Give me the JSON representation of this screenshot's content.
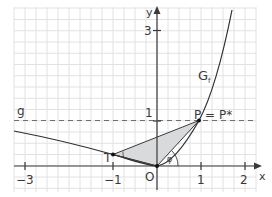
{
  "figure": {
    "grid": {
      "x_min": -3.25,
      "x_max": 2.2,
      "y_min": -0.55,
      "y_max": 3.55,
      "minor_step": 0.25
    },
    "axes": {
      "x_label": "x",
      "y_label": "y",
      "origin_label": "O",
      "x_ticks": [
        {
          "value": -3,
          "label": "−3"
        },
        {
          "value": -1,
          "label": "−1"
        },
        {
          "value": 1,
          "label": "1"
        },
        {
          "value": 2,
          "label": "2"
        }
      ],
      "y_ticks": [
        {
          "value": 1,
          "label": "1"
        },
        {
          "value": 3,
          "label": "3"
        }
      ]
    },
    "curve": {
      "label": "G",
      "subscript": "f"
    },
    "asymptote": {
      "label": "g",
      "y": 1,
      "style": "dashed"
    },
    "points": {
      "T": {
        "label": "T",
        "x": -1,
        "y": 0.25
      },
      "O": {
        "label": "O",
        "x": 0,
        "y": 0
      },
      "P": {
        "label": "P = P*",
        "x": 1,
        "y": 1
      }
    },
    "triangle": [
      "T",
      "O",
      "P"
    ],
    "angle_label": "φ",
    "colors": {
      "grid": "#e2e2e2",
      "axis": "#3a3a3a",
      "curve": "#2e2e2e",
      "shade": "#d9dadc",
      "dashed": "#707070"
    }
  }
}
